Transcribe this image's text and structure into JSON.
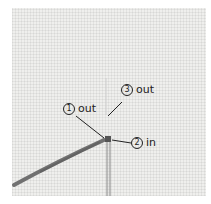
{
  "diagram": {
    "type": "embroidery-stitch-diagram",
    "labels": [
      {
        "number": "1",
        "text": "out"
      },
      {
        "number": "2",
        "text": "in"
      },
      {
        "number": "3",
        "text": "out"
      }
    ],
    "colors": {
      "fabric": "#efefed",
      "thread": "#6a6a6a",
      "ink": "#222222"
    }
  }
}
